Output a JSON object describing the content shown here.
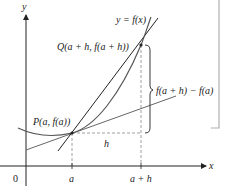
{
  "diagram": {
    "axes": {
      "x_label": "x",
      "y_label": "y",
      "origin_label": "0"
    },
    "curve_label": "y = f(x)",
    "points": {
      "P": {
        "label": "P(a, f(a))"
      },
      "Q": {
        "label": "Q(a + h, f(a + h))"
      }
    },
    "ticks": {
      "a": "a",
      "a_plus_h": "a + h"
    },
    "increment_label": "h",
    "difference_label": "f(a + h) − f(a)",
    "lines": [
      "curve y = f(x)",
      "secant line PQ",
      "tangent line at P"
    ],
    "colors": {
      "ink": "#222222",
      "curve": "#555555",
      "dashed": "#888888",
      "frame": "#b0b0b0"
    }
  }
}
